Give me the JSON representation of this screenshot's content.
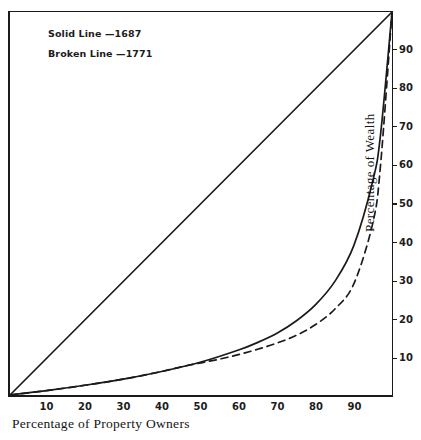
{
  "chart_data": {
    "type": "line",
    "title": "",
    "subtitle": "",
    "xlabel": "Percentage of Property Owners",
    "ylabel": "Percentage of Wealth",
    "xlim": [
      0,
      100
    ],
    "ylim": [
      0,
      100
    ],
    "grid": false,
    "legend_position": "top-left",
    "x_ticks": [
      10,
      20,
      30,
      40,
      50,
      60,
      70,
      80,
      90
    ],
    "y_ticks": [
      10,
      20,
      30,
      40,
      50,
      60,
      70,
      80,
      90
    ],
    "x_tick_labels": [
      "10",
      "20",
      "30",
      "40",
      "50",
      "60",
      "70",
      "80",
      "90"
    ],
    "y_tick_labels": [
      "10",
      "20",
      "30",
      "40",
      "50",
      "60",
      "70",
      "80",
      "90"
    ],
    "series": [
      {
        "name": "Line of equality",
        "style": "solid",
        "annotation": "",
        "x": [
          0,
          100
        ],
        "values": [
          0,
          100
        ]
      },
      {
        "name": "Solid Line —1687",
        "style": "solid",
        "annotation": "Solid Line —1687",
        "x": [
          0,
          10,
          20,
          30,
          40,
          50,
          60,
          65,
          70,
          75,
          80,
          85,
          90,
          95,
          97,
          100
        ],
        "values": [
          0,
          1.2,
          2.6,
          4.2,
          6.2,
          8.6,
          11.8,
          13.8,
          16.2,
          19.4,
          23.6,
          29.6,
          39.0,
          56.0,
          68.0,
          100
        ]
      },
      {
        "name": "Broken Line —1771",
        "style": "dashed",
        "annotation": "Broken Line —1771",
        "x": [
          0,
          10,
          20,
          30,
          40,
          45,
          50,
          55,
          60,
          65,
          70,
          75,
          80,
          85,
          90,
          95,
          97,
          100
        ],
        "values": [
          0,
          1.2,
          2.6,
          4.2,
          6.2,
          7.4,
          8.4,
          9.4,
          10.6,
          12.0,
          13.6,
          15.6,
          18.4,
          22.4,
          29.0,
          45.0,
          60.0,
          100
        ]
      }
    ]
  },
  "legend": {
    "items": [
      {
        "label": "Solid Line —1687"
      },
      {
        "label": "Broken Line —1771"
      }
    ]
  },
  "axes": {
    "x_title": "Percentage of Property Owners",
    "y_title": "Percentage of Wealth"
  },
  "colors": {
    "ink": "#1a1a1a",
    "background": "#ffffff"
  }
}
